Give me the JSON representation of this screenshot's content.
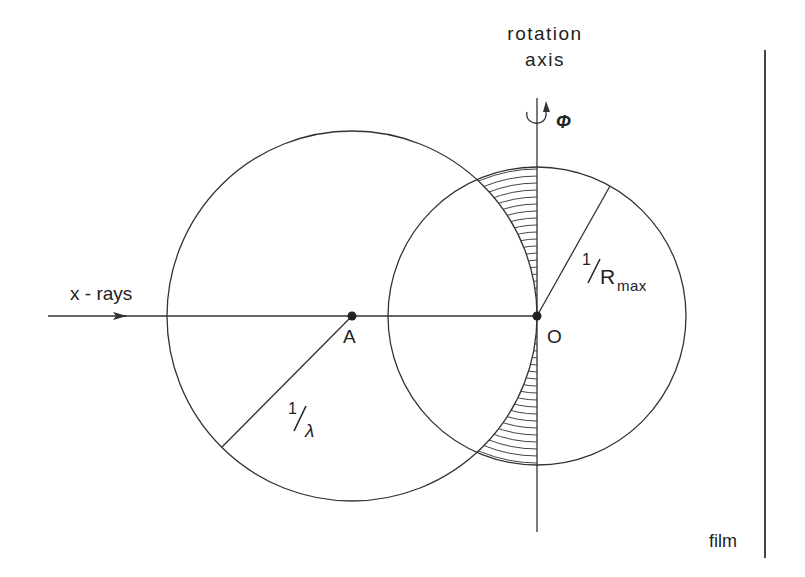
{
  "labels": {
    "rotation_axis_line1": "rotation",
    "rotation_axis_line2": "axis",
    "phi": "Φ",
    "xrays": "x - rays",
    "point_a": "A",
    "point_o": "O",
    "inv_lambda_num": "1",
    "inv_lambda_den": "λ",
    "inv_rmax_num": "1",
    "inv_rmax_den": "R",
    "inv_rmax_sub": "max",
    "film": "film"
  },
  "geometry": {
    "ewald_sphere": {
      "cx": 352,
      "cy": 316,
      "r": 185
    },
    "limiting_sphere": {
      "cx": 537,
      "cy": 316,
      "r": 149
    },
    "rotation_axis": {
      "x": 537,
      "y1": 98,
      "y2": 532
    },
    "film": {
      "x": 765,
      "y1": 50,
      "y2": 558
    },
    "xray_beam": {
      "x1": 48,
      "x2": 537,
      "y": 316
    },
    "hatch_spacing": 7
  },
  "colors": {
    "line": "#333333",
    "text": "#222222",
    "background": "#ffffff"
  }
}
